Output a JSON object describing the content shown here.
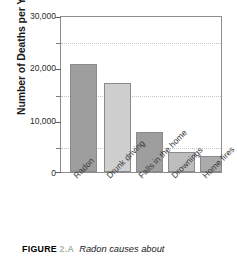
{
  "chart_data": {
    "type": "bar",
    "title": "",
    "xlabel": "",
    "ylabel": "Number of Deaths per Year",
    "categories": [
      "Radon",
      "Drunk driving",
      "Falls in the home",
      "Drownings",
      "Home fires"
    ],
    "values": [
      21000,
      17300,
      7700,
      3900,
      3100
    ],
    "series": [
      {
        "name": "Number of Deaths per Year",
        "values": [
          21000,
          17300,
          7700,
          3900,
          3100
        ]
      }
    ],
    "ylim": [
      0,
      30000
    ],
    "ytick_labels": [
      "0",
      "10,000",
      "20,000",
      "30,000"
    ],
    "ytick_values": [
      0,
      10000,
      20000,
      30000
    ],
    "minor_tick_values": [
      5000,
      15000,
      25000
    ],
    "grid": "horizontal-dotted-minor",
    "legend": "none",
    "bar_colors": [
      "#9e9e9e",
      "#cfcfcf",
      "#9e9e9e",
      "#bdbdbd",
      "#ababab"
    ],
    "axis_color": "#8d8d8d",
    "gridline_color": "#c4c4c4"
  },
  "caption": {
    "figure_word": "FIGURE",
    "figure_number": "2.A",
    "text": "Radon causes about"
  }
}
